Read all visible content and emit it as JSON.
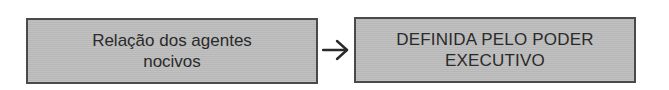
{
  "diagram": {
    "nodes": [
      {
        "id": "source",
        "lines": [
          "Relação dos agentes",
          "nocivos"
        ]
      },
      {
        "id": "target",
        "lines": [
          "DEFINIDA PELO PODER",
          "EXECUTIVO"
        ]
      }
    ],
    "edges": [
      {
        "from": "source",
        "to": "target",
        "icon": "arrow-right-icon"
      }
    ],
    "colors": {
      "box_fill": "#bdbdbd",
      "box_border": "#4a4a4a",
      "text": "#2a2a2a",
      "arrow": "#2a2a2a",
      "background": "#ffffff"
    }
  }
}
